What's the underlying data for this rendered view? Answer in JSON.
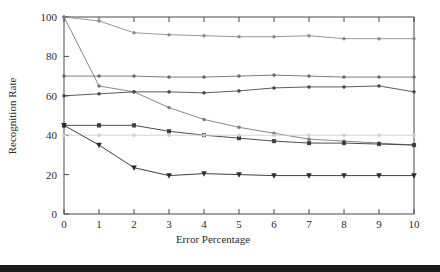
{
  "chart_data": {
    "type": "line",
    "title": "",
    "xlabel": "Error Percentage",
    "ylabel": "Recognition Rate",
    "x": [
      0,
      1,
      2,
      3,
      4,
      5,
      6,
      7,
      8,
      9,
      10
    ],
    "xlim": [
      0,
      10
    ],
    "ylim": [
      0,
      100
    ],
    "xticks": [
      "0",
      "1",
      "2",
      "3",
      "4",
      "5",
      "6",
      "7",
      "8",
      "9",
      "10"
    ],
    "yticks": [
      "0",
      "20",
      "40",
      "60",
      "80",
      "100"
    ],
    "grid": false,
    "legend": "none",
    "series": [
      {
        "name": "series-1-top-gradual",
        "color": "#8c8c8c",
        "marker": "dot",
        "values": [
          100,
          98,
          92,
          91,
          90.5,
          90,
          90,
          90.5,
          89,
          89,
          89
        ]
      },
      {
        "name": "series-2-steep-decline",
        "color": "#7a7a7a",
        "marker": "dot",
        "values": [
          100,
          65,
          62,
          54,
          48,
          44,
          41,
          38,
          37,
          36,
          35
        ]
      },
      {
        "name": "series-3-flat-seventy",
        "color": "#6e6e6e",
        "marker": "dot",
        "values": [
          70,
          70,
          70,
          69.5,
          69.5,
          70,
          70.5,
          70,
          69.5,
          69.5,
          69.5
        ]
      },
      {
        "name": "series-4-sixty-rising",
        "color": "#4a4a4a",
        "marker": "dot",
        "values": [
          60,
          61,
          62,
          62,
          61.5,
          62.5,
          64,
          64.5,
          64.5,
          65,
          62
        ]
      },
      {
        "name": "series-5-fortyfive-decline",
        "color": "#3a3a3a",
        "marker": "square",
        "values": [
          45,
          45,
          45,
          42,
          40,
          38.5,
          37,
          36,
          36,
          35.5,
          35
        ]
      },
      {
        "name": "series-6-flat-forty",
        "color": "#cfcfcf",
        "marker": "dot",
        "values": [
          40,
          40,
          40,
          40,
          40,
          40,
          40,
          40,
          40,
          40,
          40
        ]
      },
      {
        "name": "series-7-steep-to-twenty",
        "color": "#2b2b2b",
        "marker": "triangle",
        "values": [
          45,
          35,
          23.5,
          19.5,
          20.5,
          20,
          19.5,
          19.5,
          19.5,
          19.5,
          19.5
        ]
      }
    ]
  },
  "chart": {
    "xlabel": "Error Percentage",
    "ylabel": "Recognition Rate"
  }
}
